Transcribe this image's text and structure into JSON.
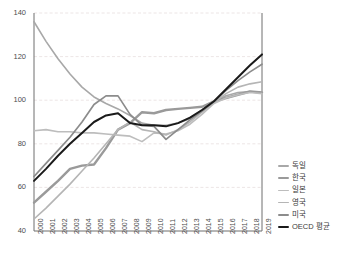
{
  "chart_data": {
    "type": "line",
    "title": "",
    "xlabel": "",
    "ylabel": "",
    "xlim": [
      2000,
      2019
    ],
    "ylim": [
      40,
      140
    ],
    "yticks": [
      40,
      60,
      80,
      100,
      120,
      140
    ],
    "grid": true,
    "legend_position": "right",
    "categories": [
      "2000",
      "2001",
      "2002",
      "2003",
      "2004",
      "2005",
      "2006",
      "2007",
      "2008",
      "2009",
      "2010",
      "2011",
      "2012",
      "2013",
      "2014",
      "2015",
      "2016",
      "2017",
      "2018",
      "2019"
    ],
    "series": [
      {
        "name": "독일",
        "color": "#a8a8a8",
        "width": 1.6,
        "values": [
          136.0,
          127.0,
          119.0,
          112.0,
          106.0,
          101.5,
          98.5,
          96.0,
          93.0,
          89.5,
          88.5,
          88.5,
          89.5,
          91.5,
          95.5,
          99.5,
          102.0,
          103.5,
          104.0,
          103.5
        ]
      },
      {
        "name": "한국",
        "color": "#9a9a9a",
        "width": 2.4,
        "values": [
          53.0,
          58.0,
          63.0,
          68.5,
          70.0,
          70.5,
          78.0,
          86.5,
          89.5,
          94.5,
          94.0,
          95.5,
          96.0,
          96.5,
          97.0,
          99.5,
          101.0,
          102.5,
          104.0,
          103.5
        ]
      },
      {
        "name": "일본",
        "color": "#bdbdbd",
        "width": 1.6,
        "values": [
          86.0,
          86.5,
          85.5,
          85.5,
          85.0,
          85.0,
          84.5,
          84.0,
          83.5,
          81.0,
          85.0,
          84.5,
          86.0,
          89.0,
          93.5,
          98.5,
          101.0,
          102.5,
          103.5,
          103.0
        ]
      },
      {
        "name": "영국",
        "color": "#b5b5b5",
        "width": 1.6,
        "values": [
          45.5,
          50.5,
          56.0,
          61.5,
          67.5,
          73.5,
          80.0,
          86.5,
          90.0,
          86.5,
          85.5,
          84.0,
          86.5,
          90.0,
          94.5,
          99.0,
          103.0,
          106.0,
          107.5,
          108.5
        ]
      },
      {
        "name": "미국",
        "color": "#8c8c8c",
        "width": 1.7,
        "values": [
          65.0,
          71.0,
          77.0,
          83.0,
          90.0,
          98.0,
          102.0,
          102.0,
          93.5,
          88.5,
          88.0,
          82.0,
          86.5,
          91.0,
          95.0,
          99.5,
          104.5,
          109.0,
          113.0,
          116.5
        ]
      },
      {
        "name": "OECD 평균",
        "color": "#1a1a1a",
        "width": 2.0,
        "values": [
          63.0,
          68.5,
          74.5,
          80.0,
          85.0,
          90.0,
          93.0,
          94.0,
          89.5,
          88.5,
          88.5,
          88.0,
          89.5,
          92.0,
          95.5,
          99.5,
          105.0,
          110.5,
          116.0,
          121.0
        ]
      }
    ]
  },
  "axis": {
    "y_tick_labels": [
      "140",
      "120",
      "100",
      "80",
      "60",
      "40"
    ],
    "x_tick_labels": [
      "2000",
      "2001",
      "2002",
      "2003",
      "2004",
      "2005",
      "2006",
      "2007",
      "2008",
      "2009",
      "2010",
      "2011",
      "2012",
      "2013",
      "2014",
      "2015",
      "2016",
      "2017",
      "2018",
      "2019"
    ]
  },
  "legend": {
    "items": [
      {
        "label": "독일",
        "color": "#a8a8a8",
        "thickness": "1.6"
      },
      {
        "label": "한국",
        "color": "#9a9a9a",
        "thickness": "2.4"
      },
      {
        "label": "일본",
        "color": "#bdbdbd",
        "thickness": "1.6"
      },
      {
        "label": "영국",
        "color": "#b5b5b5",
        "thickness": "1.6"
      },
      {
        "label": "미국",
        "color": "#8c8c8c",
        "thickness": "1.7"
      },
      {
        "label": "OECD 평균",
        "color": "#1a1a1a",
        "thickness": "2.2"
      }
    ]
  },
  "style": {
    "axis_color": "#6f6f6f",
    "grid_color": "#e7dede",
    "tick_text_color": "#4d4d4d",
    "background": "#ffffff"
  }
}
